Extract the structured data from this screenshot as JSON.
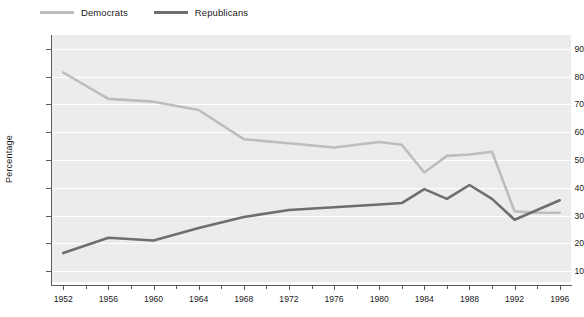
{
  "legend": {
    "position": "top-left",
    "items": [
      {
        "label": "Democrats",
        "color": "#bdbdbd",
        "name": "legend-democrats"
      },
      {
        "label": "Republicans",
        "color": "#6e6e6e",
        "name": "legend-republicans"
      }
    ]
  },
  "axes": {
    "ylabel": "Percentage",
    "xlabel": "",
    "yticks": [
      10,
      20,
      30,
      40,
      50,
      60,
      70,
      80,
      90
    ],
    "ylim": [
      5,
      95
    ],
    "xticks": [
      1952,
      1956,
      1960,
      1964,
      1968,
      1972,
      1976,
      1980,
      1984,
      1988,
      1992,
      1996
    ],
    "xminor": [
      1954,
      1958,
      1962,
      1966,
      1970,
      1974,
      1978,
      1982,
      1986,
      1990,
      1994
    ],
    "xlim": [
      1951,
      1997
    ],
    "grid": "horizontal-white"
  },
  "chart_data": {
    "type": "line",
    "title": "",
    "xlabel": "",
    "ylabel": "Percentage",
    "ylim": [
      5,
      95
    ],
    "xlim": [
      1951,
      1997
    ],
    "grid": true,
    "legend_position": "top-left",
    "x": [
      1952,
      1956,
      1960,
      1964,
      1968,
      1972,
      1976,
      1980,
      1982,
      1984,
      1986,
      1988,
      1990,
      1992,
      1994,
      1996
    ],
    "series": [
      {
        "name": "Democrats",
        "color": "#bdbdbd",
        "values": [
          81.5,
          72.0,
          71.0,
          68.0,
          57.5,
          56.0,
          54.5,
          56.5,
          55.5,
          45.5,
          51.5,
          52.0,
          53.0,
          31.5,
          31.0,
          31.0
        ]
      },
      {
        "name": "Republicans",
        "color": "#6e6e6e",
        "values": [
          16.5,
          22.0,
          21.0,
          25.5,
          29.5,
          32.0,
          33.0,
          34.0,
          34.5,
          39.5,
          36.0,
          41.0,
          36.0,
          28.5,
          32.0,
          35.5
        ]
      }
    ]
  }
}
